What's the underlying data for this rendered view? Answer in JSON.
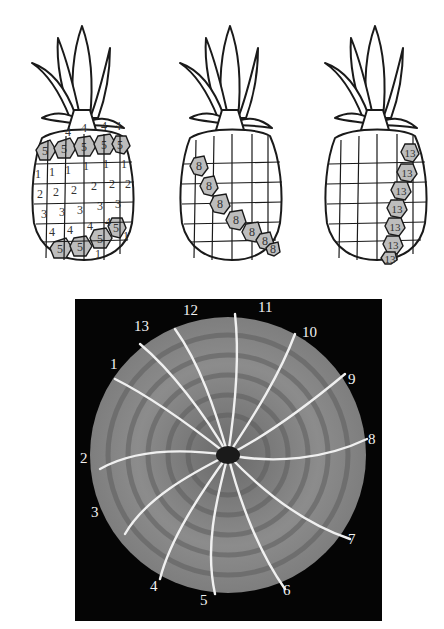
{
  "figure": {
    "pineapples": [
      {
        "id": "pineapple-1",
        "highlight_count": 5,
        "rows": [
          [
            "4",
            "4",
            "4",
            "4"
          ],
          [
            "5",
            "5",
            "5",
            "5",
            "5",
            "5"
          ],
          [
            "1",
            "1",
            "1",
            "1",
            "1",
            "1",
            "1"
          ],
          [
            "2",
            "2",
            "2",
            "2",
            "2",
            "2"
          ],
          [
            "3",
            "3",
            "3",
            "3",
            "3",
            "3",
            "3"
          ],
          [
            "4",
            "4",
            "4",
            "4",
            "4",
            "4"
          ],
          [
            "5",
            "5",
            "5",
            "5",
            "5",
            "1"
          ]
        ]
      },
      {
        "id": "pineapple-2",
        "highlight_count": 8,
        "highlighted_labels": [
          "8",
          "8",
          "8",
          "8",
          "8",
          "8",
          "8",
          "8"
        ]
      },
      {
        "id": "pineapple-3",
        "highlight_count": 13,
        "highlighted_labels": [
          "13",
          "13",
          "13",
          "13",
          "13",
          "13",
          "13",
          "13"
        ]
      }
    ],
    "pine_cone": {
      "spiral_count": 13,
      "labels": [
        {
          "text": "1",
          "x": 110,
          "y": 365
        },
        {
          "text": "2",
          "x": 80,
          "y": 459
        },
        {
          "text": "3",
          "x": 91,
          "y": 513
        },
        {
          "text": "4",
          "x": 150,
          "y": 587
        },
        {
          "text": "5",
          "x": 200,
          "y": 601
        },
        {
          "text": "6",
          "x": 283,
          "y": 591
        },
        {
          "text": "7",
          "x": 348,
          "y": 540
        },
        {
          "text": "8",
          "x": 368,
          "y": 440
        },
        {
          "text": "9",
          "x": 348,
          "y": 380
        },
        {
          "text": "10",
          "x": 302,
          "y": 333
        },
        {
          "text": "11",
          "x": 258,
          "y": 308
        },
        {
          "text": "12",
          "x": 183,
          "y": 311
        },
        {
          "text": "13",
          "x": 134,
          "y": 327
        }
      ]
    }
  },
  "colors": {
    "background": "#ffffff",
    "line": "#1a1a1a",
    "highlight_fill": "#bdbdbd",
    "photo_background": "#050505",
    "cone_fill": "#8a8a8a",
    "spiral_line": "#f0f0f0",
    "label_text": "#f2f2f2"
  }
}
